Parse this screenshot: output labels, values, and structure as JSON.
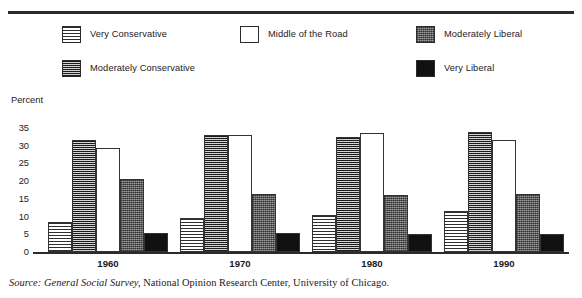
{
  "legend": {
    "items": [
      {
        "label": "Very Conservative",
        "swatch": "horizontal-lines-swatch",
        "pattern": "pat-hline",
        "x": 62,
        "y": 2
      },
      {
        "label": "Moderately Conservative",
        "swatch": "dense-hatch-swatch",
        "pattern": "pat-dense",
        "x": 62,
        "y": 36
      },
      {
        "label": "Middle of the Road",
        "swatch": "white-swatch",
        "pattern": "pat-white",
        "x": 240,
        "y": 2
      },
      {
        "label": "Moderately Liberal",
        "swatch": "stipple-gray-swatch",
        "pattern": "pat-stipple",
        "x": 416,
        "y": 2
      },
      {
        "label": "Very Liberal",
        "swatch": "solid-black-swatch",
        "pattern": "pat-black",
        "x": 416,
        "y": 36
      }
    ]
  },
  "axis": {
    "y_title": "Percent",
    "y_ticks": [
      "35",
      "30",
      "25",
      "20",
      "15",
      "10",
      "5"
    ],
    "y_zero": "0"
  },
  "source": {
    "prefix": "Source:",
    "italic_part": "General Social Survey,",
    "rest": "National Opinion Research Center, University of Chicago."
  },
  "chart_data": {
    "type": "bar",
    "title": "",
    "xlabel": "",
    "ylabel": "Percent",
    "ylim": [
      0,
      35
    ],
    "yticks": [
      5,
      10,
      15,
      20,
      25,
      30,
      35
    ],
    "grid": false,
    "legend_position": "top",
    "categories": [
      "1960",
      "1970",
      "1980",
      "1990"
    ],
    "series": [
      {
        "name": "Very Conservative",
        "pattern": "pat-hline",
        "values": [
          8.5,
          9.5,
          10.5,
          11.5
        ]
      },
      {
        "name": "Moderately Conservative",
        "pattern": "pat-dense",
        "values": [
          31.5,
          33.0,
          32.5,
          34.0
        ]
      },
      {
        "name": "Middle of the Road",
        "pattern": "pat-white",
        "values": [
          29.5,
          33.0,
          33.5,
          31.5
        ]
      },
      {
        "name": "Moderately Liberal",
        "pattern": "pat-stipple",
        "values": [
          20.5,
          16.5,
          16.0,
          16.5
        ]
      },
      {
        "name": "Very Liberal",
        "pattern": "pat-black",
        "values": [
          5.5,
          5.5,
          5.0,
          5.0
        ]
      }
    ]
  },
  "layout": {
    "group_centers": [
      108,
      240,
      372,
      504
    ],
    "bar_width": 24,
    "plot_height_px": 157,
    "value_max": 35
  }
}
